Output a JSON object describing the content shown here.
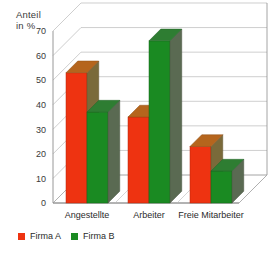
{
  "chart_data": {
    "type": "bar",
    "title": "",
    "subtitle": "",
    "ylabel": "Anteil\nin  %",
    "xlabel": "",
    "categories": [
      "Angestellte",
      "Arbeiter",
      "Freie  Mitarbeiter"
    ],
    "series": [
      {
        "name": "Firma  A",
        "color": "#ee3311",
        "values": [
          53,
          35,
          23
        ]
      },
      {
        "name": "Firma  B",
        "color": "#1a8a22",
        "values": [
          37,
          66,
          13
        ]
      }
    ],
    "ylim": [
      0,
      70
    ],
    "yticks": [
      0,
      10,
      20,
      30,
      40,
      50,
      60,
      70
    ],
    "ytick_labels": [
      "0",
      "10",
      "20",
      "30",
      "40",
      "50",
      "60",
      "70"
    ],
    "grid": true,
    "grid_axis": "y",
    "legend_position": "bottom-left",
    "projection": "3d-bar",
    "style": {
      "plot_background": "#ffffff",
      "grid_color": "#b9b9b9",
      "axis_color": "#8d8d8d",
      "red_top": "#b5651d",
      "red_side": "#7a6a3a",
      "green_top": "#2e7d32",
      "green_side": "#5a6a52"
    }
  },
  "legend": {
    "items": [
      {
        "label": "Firma  A",
        "color": "#ee3311"
      },
      {
        "label": "Firma  B",
        "color": "#1a8a22"
      }
    ]
  }
}
